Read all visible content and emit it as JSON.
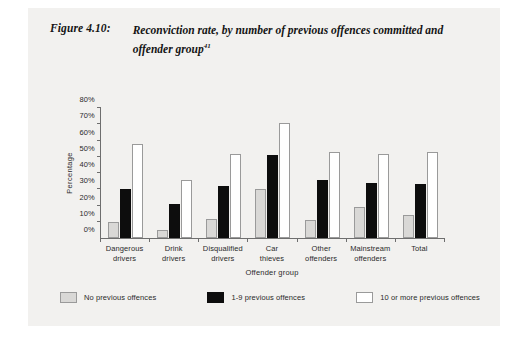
{
  "figure": {
    "label": "Figure 4.10:",
    "title": "Reconviction rate, by number of previous offences committed and offender group",
    "footnote_marker": "41"
  },
  "chart_data": {
    "type": "bar",
    "title": "Reconviction rate, by number of previous offences committed and offender group",
    "xlabel": "Offender group",
    "ylabel": "Percentage",
    "ylim": [
      0,
      80
    ],
    "yticks": [
      "0%",
      "10%",
      "20%",
      "30%",
      "40%",
      "50%",
      "60%",
      "70%",
      "80%"
    ],
    "ytick_values": [
      0,
      10,
      20,
      30,
      40,
      50,
      60,
      70,
      80
    ],
    "grid": false,
    "legend_position": "bottom",
    "categories": [
      "Dangerous\ndrivers",
      "Drink\ndrivers",
      "Disqualified\ndrivers",
      "Car\nthieves",
      "Other\noffenders",
      "Mainstream\noffenders",
      "Total"
    ],
    "category_lines": [
      [
        "Dangerous",
        "drivers"
      ],
      [
        "Drink",
        "drivers"
      ],
      [
        "Disqualified",
        "drivers"
      ],
      [
        "Car",
        "thieves"
      ],
      [
        "Other",
        "offenders"
      ],
      [
        "Mainstream",
        "offenders"
      ],
      [
        "Total",
        ""
      ]
    ],
    "series": [
      {
        "name": "No previous offences",
        "color": "#d9d8d6",
        "values": [
          10,
          5,
          12,
          30,
          11,
          19,
          14
        ]
      },
      {
        "name": "1-9 previous offences",
        "color": "#0d0d0d",
        "values": [
          30,
          21,
          32,
          51,
          36,
          34,
          33
        ]
      },
      {
        "name": "10  or more previous offences",
        "color": "#ffffff",
        "values": [
          58,
          36,
          52,
          71,
          53,
          52,
          53
        ]
      }
    ]
  },
  "colors": {
    "panel_background": "#f2f1ef",
    "axis": "#6e6e6e",
    "text": "#2a2a2a"
  }
}
